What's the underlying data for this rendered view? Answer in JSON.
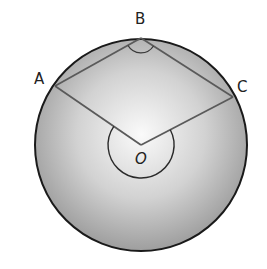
{
  "diagram": {
    "title": "",
    "circle": {
      "cx": 141,
      "cy": 145,
      "r": 106
    },
    "points": {
      "A": {
        "label": "A",
        "x": 55,
        "y": 86
      },
      "B": {
        "label": "B",
        "x": 141,
        "y": 38
      },
      "C": {
        "label": "C",
        "x": 233,
        "y": 97
      },
      "O": {
        "label": "O",
        "x": 141,
        "y": 145
      }
    },
    "segments": [
      "AB",
      "BC",
      "OA",
      "OC"
    ],
    "angle_marks": [
      {
        "vertex": "B",
        "type": "inscribed angle ABC",
        "radius": 15
      },
      {
        "vertex": "O",
        "type": "reflex central angle AOC",
        "radius": 33
      }
    ],
    "colors": {
      "circle_stroke": "#1a1a1a",
      "fill_center": "#fafafa",
      "fill_edge": "#9e9e9e",
      "line": "#5a5a5a",
      "label": "#222222"
    }
  }
}
